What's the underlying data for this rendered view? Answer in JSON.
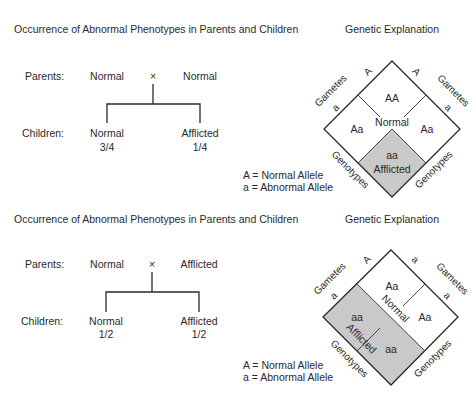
{
  "panels": [
    {
      "title": "Occurrence of Abnormal Phenotypes in Parents and Children",
      "explanation_title": "Genetic Explanation",
      "parents_label": "Parents:",
      "children_label": "Children:",
      "cross_symbol": "×",
      "parent1": "Normal",
      "parent2": "Normal",
      "child1": {
        "phenotype": "Normal",
        "ratio": "3/4"
      },
      "child2": {
        "phenotype": "Afflicted",
        "ratio": "1/4"
      },
      "legend": [
        "A = Normal Allele",
        "a = Abnormal Allele"
      ],
      "punnett": {
        "gametes_label": "Gametes",
        "genotypes_label": "Genotypes",
        "left_gametes": [
          "A",
          "a"
        ],
        "right_gametes": [
          "A",
          "a"
        ],
        "cells": {
          "top": "AA",
          "left": "Aa",
          "right": "Aa",
          "bottom": "aa"
        },
        "normal_label": "Normal",
        "afflicted_label": "Afflicted"
      }
    },
    {
      "title": "Occurrence of Abnormal Phenotypes in Parents and Children",
      "explanation_title": "Genetic Explanation",
      "parents_label": "Parents:",
      "children_label": "Children:",
      "cross_symbol": "×",
      "parent1": "Normal",
      "parent2": "Afflicted",
      "child1": {
        "phenotype": "Normal",
        "ratio": "1/2"
      },
      "child2": {
        "phenotype": "Afflicted",
        "ratio": "1/2"
      },
      "legend": [
        "A = Normal Allele",
        "a = Abnormal Allele"
      ],
      "punnett": {
        "gametes_label": "Gametes",
        "genotypes_label": "Genotypes",
        "left_gametes": [
          "A",
          "a"
        ],
        "right_gametes": [
          "a",
          "a"
        ],
        "cells": {
          "top": "Aa",
          "left": "aa",
          "right": "Aa",
          "bottom": "aa"
        },
        "normal_label": "Normal",
        "afflicted_label": "Afflicted"
      }
    }
  ],
  "colors": {
    "shaded": "#c9c9c9",
    "ink": "#2a2a2a",
    "background": "#ffffff"
  }
}
